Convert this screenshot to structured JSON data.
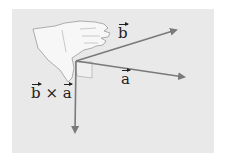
{
  "diagram": {
    "labels": {
      "b": "b",
      "a": "a",
      "cross_b": "b",
      "cross_op": " × ",
      "cross_a": "a"
    },
    "colors": {
      "background": "#e9e9e9",
      "arrow": "#7a7a7a",
      "hand_fill": "#f7f7f7",
      "hand_stroke": "#9a9a9a",
      "text": "#222222"
    }
  }
}
